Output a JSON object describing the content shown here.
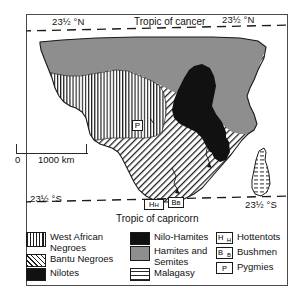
{
  "figure": {
    "tropic_north_label": "Tropic of cancer",
    "tropic_south_label": "Tropic of capricorn",
    "lat_north_left": "23½ °N",
    "lat_north_right": "23½ °N",
    "lat_south_left": "23½ °S",
    "lat_south_right": "23½ °S"
  },
  "scale": {
    "zero_label": "0",
    "distance_label": "1000 km"
  },
  "map_markers": [
    {
      "id": "pygmies-marker",
      "symbol": "P",
      "region": "congo-basin"
    },
    {
      "id": "hottentots-marker",
      "symbol": "HH",
      "region": "south-africa"
    },
    {
      "id": "bushmen-marker",
      "symbol": "BB",
      "region": "south-africa"
    }
  ],
  "legend": {
    "columns": [
      {
        "id": "column-one",
        "entries": [
          {
            "label": "West African Negroes",
            "pattern": "vertical-lines",
            "color": "#1d1d1d"
          },
          {
            "label": "Bantu Negroes",
            "pattern": "diagonal-hatch",
            "color": "#1d1d1d"
          },
          {
            "label": "Nilotes",
            "pattern": "solid-black",
            "color": "#111111"
          }
        ]
      },
      {
        "id": "column-two",
        "entries": [
          {
            "label": "Nilo-Hamites",
            "pattern": "solid-black",
            "color": "#111111"
          },
          {
            "label": "Hamites and Semites",
            "pattern": "solid-grey",
            "color": "#8e8e8e"
          },
          {
            "label": "Malagasy",
            "pattern": "horizontal-lines",
            "color": "#2a2a2a"
          }
        ]
      },
      {
        "id": "column-three",
        "entries": [
          {
            "label": "Hottentots",
            "symbol": "HH"
          },
          {
            "label": "Bushmen",
            "symbol": "BB"
          },
          {
            "label": "Pygmies",
            "symbol": "P"
          }
        ]
      }
    ]
  }
}
